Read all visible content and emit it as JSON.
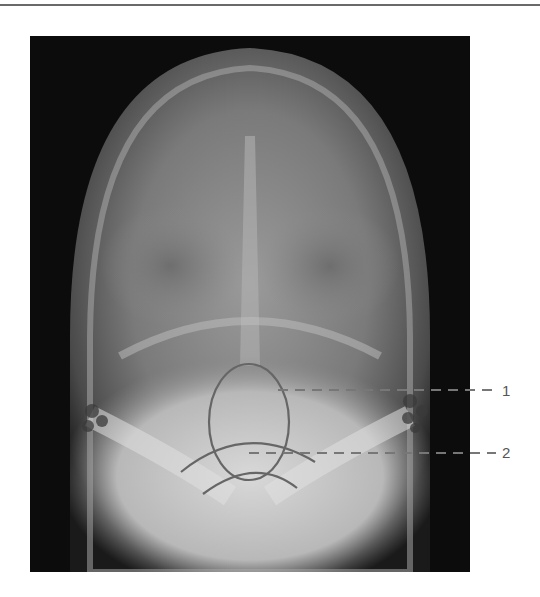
{
  "figure": {
    "type": "radiograph",
    "annotations": [
      {
        "id": "1",
        "label": "1"
      },
      {
        "id": "2",
        "label": "2"
      }
    ],
    "colors": {
      "annotation_line": "#666666",
      "background": "#ffffff",
      "film_dark": "#0c0c0c"
    }
  }
}
